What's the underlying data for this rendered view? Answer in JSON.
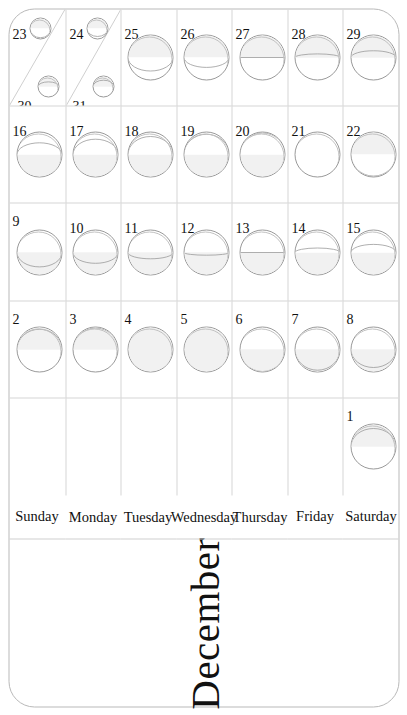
{
  "calendar": {
    "title": "December",
    "orientation": "rotated-90-ccw",
    "weekdays": [
      "Sunday",
      "Monday",
      "Tuesday",
      "Wednesday",
      "Thursday",
      "Friday",
      "Saturday"
    ],
    "columns": 5,
    "rows": 7,
    "colors": {
      "page_background": "#ffffff",
      "card_border": "#b9b9b9",
      "grid_line": "#d6d6d6",
      "moon_outline": "#9a9a9a",
      "moon_lit_fill": "#f1f1f1",
      "moon_dark_fill": "#ffffff",
      "text": "#111111"
    },
    "weeks": [
      {
        "index": 0,
        "days": [
          {
            "date": "",
            "weekday": "Sunday",
            "empty": true
          },
          {
            "date": "",
            "weekday": "Monday",
            "empty": true
          },
          {
            "date": "",
            "weekday": "Tuesday",
            "empty": true
          },
          {
            "date": "",
            "weekday": "Wednesday",
            "empty": true
          },
          {
            "date": "",
            "weekday": "Thursday",
            "empty": true
          },
          {
            "date": "",
            "weekday": "Friday",
            "empty": true
          },
          {
            "date": "1",
            "weekday": "Saturday",
            "empty": false,
            "phase": "waxing-gibbous",
            "illumination": 0.9,
            "waxing": true
          }
        ]
      },
      {
        "index": 1,
        "days": [
          {
            "date": "2",
            "weekday": "Sunday",
            "phase": "waxing-gibbous",
            "illumination": 0.95,
            "waxing": true
          },
          {
            "date": "3",
            "weekday": "Monday",
            "phase": "waxing-gibbous",
            "illumination": 0.98,
            "waxing": true
          },
          {
            "date": "4",
            "weekday": "Tuesday",
            "phase": "full-moon",
            "illumination": 1.0,
            "waxing": true
          },
          {
            "date": "5",
            "weekday": "Wednesday",
            "phase": "full-moon",
            "illumination": 1.0,
            "waxing": false
          },
          {
            "date": "6",
            "weekday": "Thursday",
            "phase": "waning-gibbous",
            "illumination": 0.99,
            "waxing": false
          },
          {
            "date": "7",
            "weekday": "Friday",
            "phase": "waning-gibbous",
            "illumination": 0.96,
            "waxing": false
          },
          {
            "date": "8",
            "weekday": "Saturday",
            "phase": "waning-gibbous",
            "illumination": 0.9,
            "waxing": false
          }
        ]
      },
      {
        "index": 2,
        "days": [
          {
            "date": "9",
            "weekday": "Sunday",
            "phase": "waning-gibbous",
            "illumination": 0.82,
            "waxing": false
          },
          {
            "date": "10",
            "weekday": "Monday",
            "phase": "waning-gibbous",
            "illumination": 0.74,
            "waxing": false
          },
          {
            "date": "11",
            "weekday": "Tuesday",
            "phase": "waning-gibbous",
            "illumination": 0.64,
            "waxing": false
          },
          {
            "date": "12",
            "weekday": "Wednesday",
            "phase": "waning-gibbous",
            "illumination": 0.56,
            "waxing": false
          },
          {
            "date": "13",
            "weekday": "Thursday",
            "phase": "last-quarter",
            "illumination": 0.5,
            "waxing": false
          },
          {
            "date": "14",
            "weekday": "Friday",
            "phase": "waning-crescent",
            "illumination": 0.4,
            "waxing": false
          },
          {
            "date": "15",
            "weekday": "Saturday",
            "phase": "waning-crescent",
            "illumination": 0.32,
            "waxing": false
          }
        ]
      },
      {
        "index": 3,
        "days": [
          {
            "date": "16",
            "weekday": "Sunday",
            "phase": "waning-crescent",
            "illumination": 0.24,
            "waxing": false
          },
          {
            "date": "17",
            "weekday": "Monday",
            "phase": "waning-crescent",
            "illumination": 0.16,
            "waxing": false
          },
          {
            "date": "18",
            "weekday": "Tuesday",
            "phase": "waning-crescent",
            "illumination": 0.1,
            "waxing": false
          },
          {
            "date": "19",
            "weekday": "Wednesday",
            "phase": "waning-crescent",
            "illumination": 0.05,
            "waxing": false
          },
          {
            "date": "20",
            "weekday": "Thursday",
            "phase": "new-moon",
            "illumination": 0.02,
            "waxing": false
          },
          {
            "date": "21",
            "weekday": "Friday",
            "phase": "new-moon",
            "illumination": 0.0,
            "waxing": true
          },
          {
            "date": "22",
            "weekday": "Saturday",
            "phase": "new-moon",
            "illumination": 0.02,
            "waxing": true
          }
        ]
      },
      {
        "index": 4,
        "days": [
          {
            "date": "23",
            "weekday": "Sunday",
            "phase": "waxing-crescent",
            "illumination": 0.06,
            "waxing": true,
            "second": {
              "date": "30",
              "phase": "waxing-gibbous",
              "illumination": 0.72,
              "waxing": true
            }
          },
          {
            "date": "24",
            "weekday": "Monday",
            "phase": "waxing-crescent",
            "illumination": 0.12,
            "waxing": true,
            "second": {
              "date": "31",
              "phase": "waxing-gibbous",
              "illumination": 0.8,
              "waxing": true
            }
          },
          {
            "date": "25",
            "weekday": "Tuesday",
            "phase": "waxing-crescent",
            "illumination": 0.2,
            "waxing": true
          },
          {
            "date": "26",
            "weekday": "Wednesday",
            "phase": "waxing-crescent",
            "illumination": 0.28,
            "waxing": true
          },
          {
            "date": "27",
            "weekday": "Thursday",
            "phase": "first-quarter",
            "illumination": 0.5,
            "waxing": true
          },
          {
            "date": "28",
            "weekday": "Friday",
            "phase": "waxing-gibbous",
            "illumination": 0.58,
            "waxing": true
          },
          {
            "date": "29",
            "weekday": "Saturday",
            "phase": "waxing-gibbous",
            "illumination": 0.65,
            "waxing": true
          }
        ]
      }
    ]
  },
  "chart_data": {
    "type": "table",
    "title": "December",
    "xlabel": "Week",
    "ylabel": "Weekday",
    "categories": [
      "Sunday",
      "Monday",
      "Tuesday",
      "Wednesday",
      "Thursday",
      "Friday",
      "Saturday"
    ],
    "series": [
      {
        "name": "Moon illumination fraction by date",
        "x": [
          "1",
          "2",
          "3",
          "4",
          "5",
          "6",
          "7",
          "8",
          "9",
          "10",
          "11",
          "12",
          "13",
          "14",
          "15",
          "16",
          "17",
          "18",
          "19",
          "20",
          "21",
          "22",
          "23",
          "24",
          "25",
          "26",
          "27",
          "28",
          "29",
          "30",
          "31"
        ],
        "values": [
          0.9,
          0.95,
          0.98,
          1.0,
          1.0,
          0.99,
          0.96,
          0.9,
          0.82,
          0.74,
          0.64,
          0.56,
          0.5,
          0.4,
          0.32,
          0.24,
          0.16,
          0.1,
          0.05,
          0.02,
          0.0,
          0.02,
          0.06,
          0.12,
          0.2,
          0.28,
          0.5,
          0.58,
          0.65,
          0.72,
          0.8
        ]
      }
    ],
    "ylim": [
      0,
      1
    ],
    "grid": true,
    "legend": "none"
  }
}
